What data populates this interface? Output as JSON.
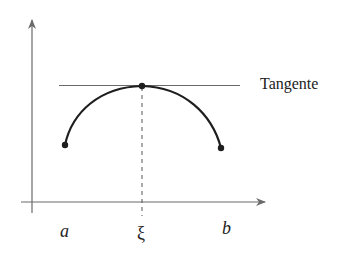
{
  "diagram": {
    "type": "mean-value-theorem-sketch",
    "labels": {
      "tangent": "Tangente",
      "a": "a",
      "xi": "ξ",
      "b": "b"
    },
    "colors": {
      "axis": "#6a6a6a",
      "curve": "#1e1e1e",
      "tangent": "#6a6a6a",
      "text": "#222222"
    }
  }
}
